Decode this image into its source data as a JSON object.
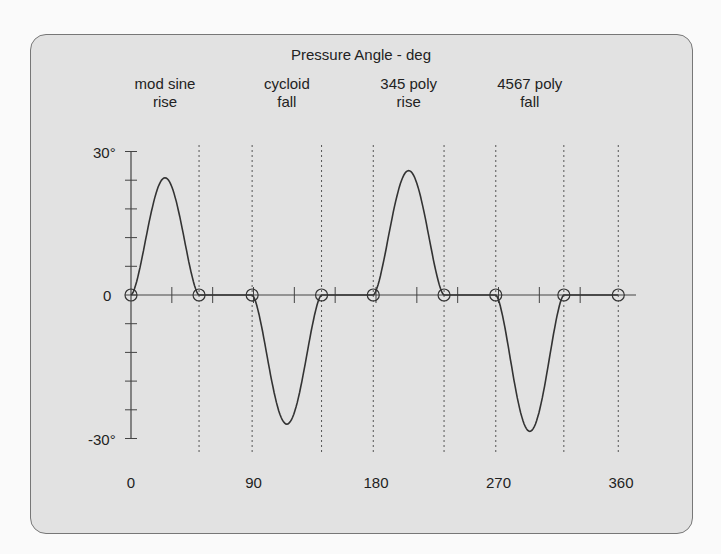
{
  "chart_data": {
    "type": "line",
    "title": "Pressure Angle - deg",
    "xlabel": "",
    "ylabel": "",
    "x_ticks": [
      "0",
      "90",
      "180",
      "270",
      "360"
    ],
    "y_ticks": [
      "30°",
      "0",
      "-30°"
    ],
    "xlim": [
      0,
      360
    ],
    "ylim": [
      -30,
      30
    ],
    "grid": false,
    "segments": [
      {
        "name": "mod sine rise",
        "line1": "mod sine",
        "line2": "rise",
        "start": 0,
        "end": 50,
        "peak": 24.5
      },
      {
        "name": "dwell",
        "start": 50,
        "end": 89,
        "peak": 0
      },
      {
        "name": "cycloid fall",
        "line1": "cycloid",
        "line2": "fall",
        "start": 89,
        "end": 140,
        "peak": -27
      },
      {
        "name": "dwell",
        "start": 140,
        "end": 178,
        "peak": 0
      },
      {
        "name": "345 poly rise",
        "line1": "345 poly",
        "line2": "rise",
        "start": 178,
        "end": 230,
        "peak": 26
      },
      {
        "name": "dwell",
        "start": 230,
        "end": 268,
        "peak": 0
      },
      {
        "name": "4567 poly fall",
        "line1": "4567 poly",
        "line2": "fall",
        "start": 268,
        "end": 318,
        "peak": -28.5
      },
      {
        "name": "dwell",
        "start": 318,
        "end": 358,
        "peak": 0
      }
    ],
    "markers_x": [
      0,
      50,
      89,
      140,
      178,
      230,
      268,
      318,
      358
    ]
  }
}
